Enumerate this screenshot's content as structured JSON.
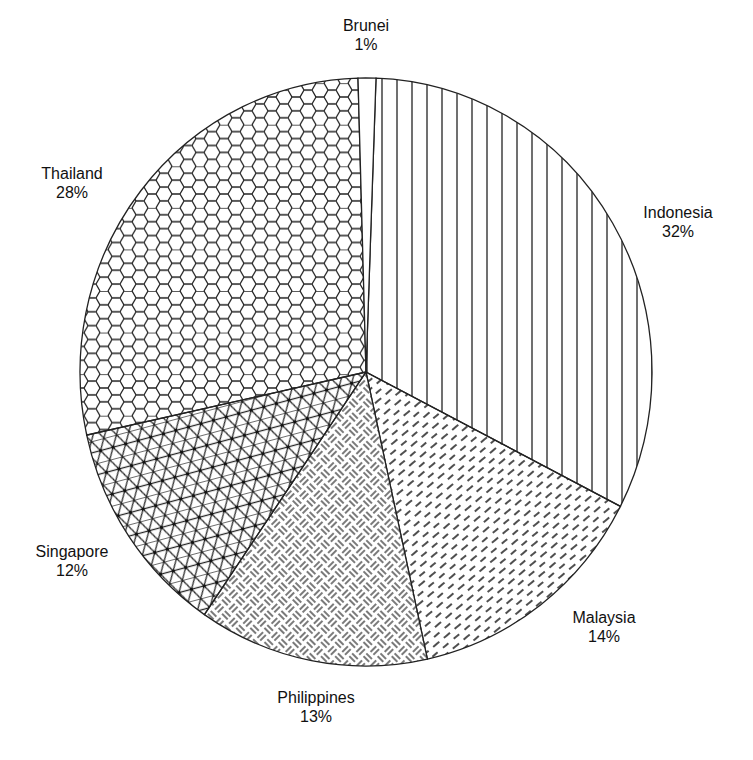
{
  "chart_data": {
    "type": "pie",
    "title": "",
    "start_angle_deg": 2,
    "direction": "clockwise",
    "slices": [
      {
        "label": "Indonesia",
        "value": 32,
        "display": "32%",
        "pattern": "vertical-lines"
      },
      {
        "label": "Malaysia",
        "value": 14,
        "display": "14%",
        "pattern": "diagonal-dashes"
      },
      {
        "label": "Philippines",
        "value": 13,
        "display": "13%",
        "pattern": "basketweave"
      },
      {
        "label": "Singapore",
        "value": 12,
        "display": "12%",
        "pattern": "triangular-grid"
      },
      {
        "label": "Thailand",
        "value": 28,
        "display": "28%",
        "pattern": "hexagons"
      },
      {
        "label": "Brunei",
        "value": 1,
        "display": "1%",
        "pattern": "none"
      }
    ],
    "legend": "none",
    "colors": {
      "stroke": "#222222",
      "fill": "#ffffff"
    }
  },
  "labels": {
    "brunei": {
      "name": "Brunei",
      "pct": "1%"
    },
    "indonesia": {
      "name": "Indonesia",
      "pct": "32%"
    },
    "malaysia": {
      "name": "Malaysia",
      "pct": "14%"
    },
    "philippines": {
      "name": "Philippines",
      "pct": "13%"
    },
    "singapore": {
      "name": "Singapore",
      "pct": "12%"
    },
    "thailand": {
      "name": "Thailand",
      "pct": "28%"
    }
  }
}
